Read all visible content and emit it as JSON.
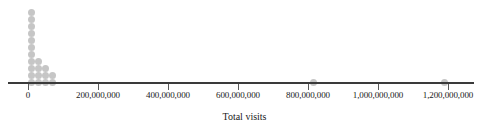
{
  "chart_data": {
    "type": "scatter",
    "plot_style": "dotplot",
    "title": "",
    "xlabel": "Total visits",
    "ylabel": "",
    "xlim": [
      -60000000,
      1330000000
    ],
    "xticks": [
      0,
      200000000,
      400000000,
      600000000,
      800000000,
      1000000000,
      1200000000
    ],
    "xtick_labels": [
      "0",
      "200,000,000",
      "400,000,000",
      "600,000,000",
      "800,000,000",
      "1,000,000,000",
      "1,200,000,000"
    ],
    "grid": false,
    "legend": null,
    "dot_color": "#c6c6c6",
    "axis_color": "#3a3a3a",
    "stacks": [
      {
        "x": 10000000,
        "count": 11
      },
      {
        "x": 30000000,
        "count": 4
      },
      {
        "x": 50000000,
        "count": 3
      },
      {
        "x": 70000000,
        "count": 2
      },
      {
        "x": 815000000,
        "count": 1
      },
      {
        "x": 1190000000,
        "count": 1
      }
    ],
    "values": [
      10000000,
      10000000,
      10000000,
      10000000,
      10000000,
      10000000,
      10000000,
      10000000,
      10000000,
      10000000,
      10000000,
      30000000,
      30000000,
      30000000,
      30000000,
      50000000,
      50000000,
      50000000,
      70000000,
      70000000,
      815000000,
      1190000000
    ],
    "n_points": 22
  },
  "axis": {
    "title": "Total visits"
  }
}
